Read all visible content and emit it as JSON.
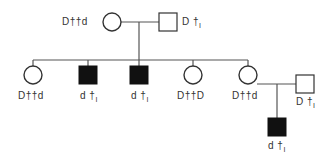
{
  "diagram": {
    "type": "pedigree",
    "colors": {
      "line": "#555555",
      "affected_fill": "#111111",
      "unaffected_fill": "#ffffff"
    },
    "individuals": [
      {
        "id": "I-1",
        "sex": "female",
        "affected": false,
        "genotype": "D††d",
        "label_parts": [
          "D",
          "††",
          "d"
        ]
      },
      {
        "id": "I-2",
        "sex": "male",
        "affected": false,
        "genotype": "D†I",
        "label_parts": [
          "D",
          "†",
          "I"
        ]
      },
      {
        "id": "II-1",
        "sex": "female",
        "affected": false,
        "genotype": "D††d",
        "label_parts": [
          "D",
          "††",
          "d"
        ]
      },
      {
        "id": "II-2",
        "sex": "male",
        "affected": true,
        "genotype": "d†I",
        "label_parts": [
          "d",
          "†",
          "I"
        ]
      },
      {
        "id": "II-3",
        "sex": "male",
        "affected": true,
        "genotype": "d†I",
        "label_parts": [
          "d",
          "†",
          "I"
        ]
      },
      {
        "id": "II-4",
        "sex": "female",
        "affected": false,
        "genotype": "D††D",
        "label_parts": [
          "D",
          "††",
          "D"
        ]
      },
      {
        "id": "II-5",
        "sex": "female",
        "affected": false,
        "genotype": "D††d",
        "label_parts": [
          "D",
          "††",
          "d"
        ]
      },
      {
        "id": "II-6",
        "sex": "male",
        "affected": false,
        "genotype": "D†I",
        "label_parts": [
          "D",
          "†",
          "I"
        ]
      },
      {
        "id": "III-1",
        "sex": "male",
        "affected": true,
        "genotype": "d†I",
        "label_parts": [
          "d",
          "†",
          "I"
        ]
      }
    ]
  }
}
